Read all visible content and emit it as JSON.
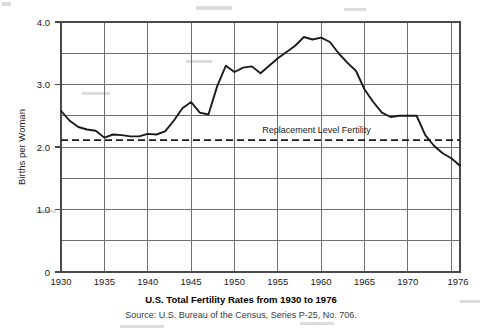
{
  "chart_data": {
    "type": "line",
    "title": "U.S. Total Fertility Rates from 1930 to 1976",
    "source": "Source: U.S. Bureau of the Census, Series P-25, No. 706.",
    "xlabel": "",
    "ylabel": "Births per Woman",
    "xlim": [
      1930,
      1976
    ],
    "ylim": [
      0,
      4.0
    ],
    "grid": true,
    "legend_position": "none",
    "x_ticks": [
      1930,
      1935,
      1940,
      1945,
      1950,
      1955,
      1960,
      1965,
      1970,
      1976
    ],
    "x_tick_labels": [
      "1930",
      "1935",
      "1940",
      "1945",
      "1950",
      "1955",
      "1960",
      "1965",
      "1970",
      "1976"
    ],
    "y_ticks": [
      0,
      1.0,
      2.0,
      3.0,
      4.0
    ],
    "y_tick_labels": [
      "0",
      "1.0",
      "2.0",
      "3.0",
      "4.0"
    ],
    "y_gridlines": [
      0,
      0.5,
      1.0,
      1.5,
      2.0,
      2.5,
      3.0,
      3.5,
      4.0
    ],
    "annotations": [
      {
        "name": "replacement-level-label",
        "text": "Replacement Level Fertility",
        "x": 1953.2,
        "y": 2.22
      }
    ],
    "reference_lines": [
      {
        "name": "replacement-level-fertility-line",
        "value": 2.11,
        "orientation": "horizontal",
        "style": "dashed",
        "label": "Replacement Level Fertility"
      }
    ],
    "series": [
      {
        "name": "U.S. Total Fertility Rate",
        "x": [
          1930,
          1931,
          1932,
          1933,
          1934,
          1935,
          1936,
          1937,
          1938,
          1939,
          1940,
          1941,
          1942,
          1943,
          1944,
          1945,
          1946,
          1947,
          1948,
          1949,
          1950,
          1951,
          1952,
          1953,
          1954,
          1955,
          1956,
          1957,
          1958,
          1959,
          1960,
          1961,
          1962,
          1963,
          1964,
          1965,
          1966,
          1967,
          1968,
          1969,
          1970,
          1971,
          1972,
          1973,
          1974,
          1975,
          1976
        ],
        "y": [
          2.58,
          2.42,
          2.32,
          2.28,
          2.26,
          2.15,
          2.2,
          2.19,
          2.17,
          2.17,
          2.21,
          2.2,
          2.25,
          2.42,
          2.62,
          2.72,
          2.55,
          2.52,
          2.97,
          3.3,
          3.2,
          3.27,
          3.29,
          3.18,
          3.3,
          3.42,
          3.52,
          3.62,
          3.76,
          3.72,
          3.75,
          3.68,
          3.5,
          3.35,
          3.22,
          2.92,
          2.72,
          2.55,
          2.48,
          2.5,
          2.5,
          2.5,
          2.19,
          2.02,
          1.9,
          1.82,
          1.7
        ]
      }
    ]
  },
  "figure": {
    "ylabel": "Births per Woman",
    "title": "U.S. Total Fertility Rates from 1930 to 1976",
    "source": "Source: U.S. Bureau of the Census, Series P-25, No. 706.",
    "annotation": "Replacement Level Fertility"
  }
}
